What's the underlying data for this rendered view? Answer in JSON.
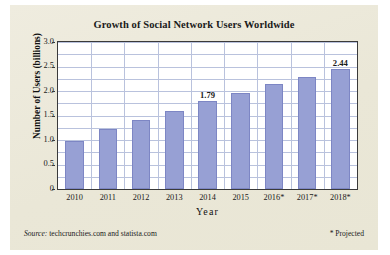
{
  "card": {
    "background_color": "#ece9da"
  },
  "chart_data": {
    "type": "bar",
    "title": "Growth of Social Network Users Worldwide",
    "xlabel": "Year",
    "ylabel": "Number of Users (billions)",
    "categories": [
      "2010",
      "2011",
      "2012",
      "2013",
      "2014",
      "2015",
      "2016*",
      "2017*",
      "2018*"
    ],
    "values": [
      0.97,
      1.22,
      1.4,
      1.59,
      1.79,
      1.96,
      2.14,
      2.28,
      2.44
    ],
    "data_labels": [
      null,
      null,
      null,
      null,
      "1.79",
      null,
      null,
      null,
      "2.44"
    ],
    "ylim": [
      0,
      3.0
    ],
    "ytick_labels": [
      "0",
      "0.5",
      "1.0",
      "1.5",
      "2.0",
      "2.5",
      "3.0"
    ],
    "ytick_values": [
      0,
      0.5,
      1.0,
      1.5,
      2.0,
      2.5,
      3.0
    ],
    "gridline_interval": 0.25,
    "grid": "horizontal-and-vertical",
    "legend": "none",
    "bar_color": "#97a0d4",
    "bar_border_color": "#7d86c4",
    "gridline_color": "#b9c2dd",
    "plot_background": "#ffffff",
    "axis_color": "#3a3a3a"
  },
  "footer": {
    "source_word": "Source:",
    "source_text": " techcrunchies.com and statista.com",
    "projected_note": "* Projected"
  }
}
